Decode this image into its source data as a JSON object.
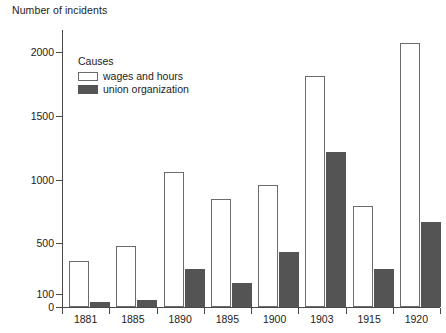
{
  "chart_data": {
    "type": "bar",
    "title": "Number of incidents",
    "xlabel": "",
    "ylabel": "Number of incidents",
    "ylim": [
      0,
      2150
    ],
    "yticks": [
      0,
      100,
      500,
      1000,
      1500,
      2000
    ],
    "ytick_labels": [
      "0",
      "100",
      "500",
      "1000",
      "1500",
      "2000"
    ],
    "grid": false,
    "legend_position": "upper-left-inside",
    "legend_title": "Causes",
    "categories": [
      "1881",
      "1885",
      "1890",
      "1895",
      "1900",
      "1903",
      "1915",
      "1920"
    ],
    "series": [
      {
        "name": "wages and hours",
        "color": "#ffffff",
        "edge_color": "#6b6b6b",
        "values": [
          360,
          480,
          1060,
          845,
          955,
          1815,
          795,
          2070
        ]
      },
      {
        "name": "union organization",
        "color": "#545454",
        "edge_color": "#545454",
        "values": [
          40,
          55,
          295,
          185,
          430,
          1215,
          295,
          670
        ]
      }
    ]
  },
  "legend": {
    "title": "Causes",
    "items": [
      {
        "label": "wages and hours",
        "swatch": "legend-swatch-wages"
      },
      {
        "label": "union organization",
        "swatch": "legend-swatch-union"
      }
    ]
  },
  "axes": {
    "y_title": "Number of incidents"
  }
}
